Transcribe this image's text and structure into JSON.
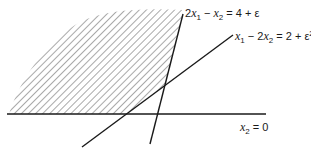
{
  "figure": {
    "type": "feasible-region-diagram",
    "colors": {
      "line": "#1a1a1a",
      "hatch": "#7a7a7a",
      "background": "#ffffff"
    },
    "labels": {
      "steep_line": {
        "coef": "2",
        "var1": "x",
        "sub1": "1",
        "minus": " − ",
        "var2": "x",
        "sub2": "2",
        "rhs": " = 4 + ε"
      },
      "shallow_line": {
        "var1": "x",
        "sub1": "1",
        "minus": " − 2",
        "var2": "x",
        "sub2": "2",
        "rhs": " = 2 + ε",
        "sup": "2"
      },
      "axis_line": {
        "var": "x",
        "sub": "2",
        "rhs": " = 0"
      }
    },
    "regions": [
      {
        "name": "feasible-region",
        "fill": "diagonal-hatch"
      }
    ]
  }
}
